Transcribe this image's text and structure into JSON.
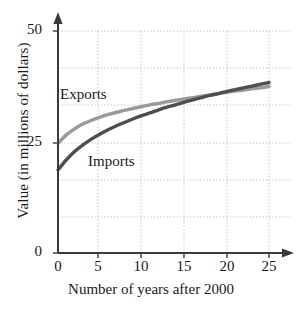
{
  "chart_data": {
    "type": "line",
    "title": "",
    "xlabel": "Number of years after 2000",
    "ylabel": "Value (in millions of dollars)",
    "xlim": [
      0,
      26
    ],
    "ylim": [
      0,
      50
    ],
    "xticks": [
      "0",
      "5",
      "10",
      "15",
      "20",
      "25"
    ],
    "xtick_values": [
      0,
      5,
      10,
      15,
      20,
      25
    ],
    "yticks": [
      "0",
      "25",
      "50"
    ],
    "ytick_values": [
      0,
      25,
      50
    ],
    "grid": "dotted both axes",
    "gridline_y_values": [
      8.3,
      16.7,
      25,
      33.3,
      41.7,
      50
    ],
    "gridline_x_values": [
      5,
      10,
      15,
      20,
      25
    ],
    "legend_position": "inline annotations on curves",
    "x": [
      0,
      1,
      2,
      3,
      4,
      5,
      6,
      7,
      8,
      9,
      10,
      11,
      12,
      13,
      14,
      15,
      16,
      17,
      18,
      19,
      20,
      21,
      22,
      23,
      24,
      25
    ],
    "series": [
      {
        "name": "Exports",
        "color": "#9a9a9a",
        "values": [
          24.7,
          26.6,
          28.0,
          29.1,
          29.9,
          30.6,
          31.2,
          31.7,
          32.2,
          32.6,
          33.0,
          33.4,
          33.7,
          34.1,
          34.4,
          34.7,
          35.0,
          35.3,
          35.6,
          35.9,
          36.2,
          36.5,
          36.7,
          37.0,
          37.2,
          37.5
        ]
      },
      {
        "name": "Imports",
        "color": "#4f4f4f",
        "values": [
          18.7,
          21.0,
          22.9,
          24.4,
          25.7,
          26.8,
          27.8,
          28.7,
          29.5,
          30.3,
          31.0,
          31.6,
          32.3,
          32.9,
          33.4,
          34.0,
          34.5,
          35.0,
          35.5,
          35.9,
          36.4,
          36.8,
          37.2,
          37.6,
          38.0,
          38.4
        ]
      }
    ],
    "annotations": [
      {
        "text": "Exports",
        "x_px": 60,
        "y_px": 88
      },
      {
        "text": "Imports",
        "x_px": 88,
        "y_px": 155
      }
    ]
  },
  "axes": {
    "x_title": "Number of years after 2000",
    "y_title": "Value (in millions of dollars)",
    "y_tick_labels": [
      "50",
      "25",
      "0"
    ],
    "x_tick_labels": [
      "0",
      "5",
      "10",
      "15",
      "20",
      "25"
    ]
  },
  "labels": {
    "exports": "Exports",
    "imports": "Imports"
  },
  "colors": {
    "exports": "#9a9a9a",
    "imports": "#4f4f4f",
    "axis": "#3a3a3a",
    "grid": "#b9b9b9"
  }
}
